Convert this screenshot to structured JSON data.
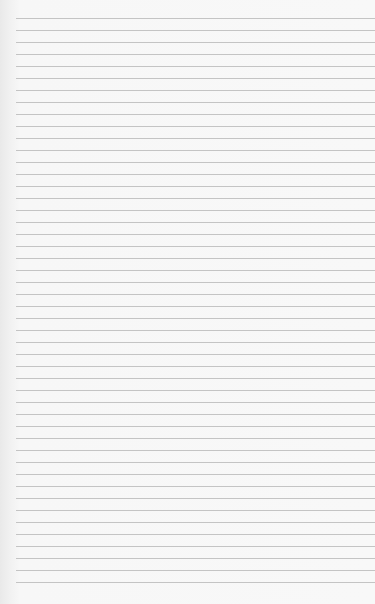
{
  "paper": {
    "type": "lined-paper",
    "background_color": "#f7f7f7",
    "line_color": "#c4c4c4",
    "line_left": 16,
    "first_line_y": 18,
    "line_spacing": 12,
    "line_count": 48
  }
}
